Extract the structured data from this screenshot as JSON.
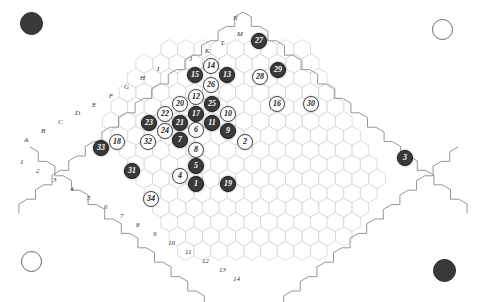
{
  "board": {
    "name": "hexagonal-go-board",
    "background_color": "#ffffff",
    "grid_color": "#cfcfcf",
    "edge_color": "#8a8a8a",
    "black_color": "#3a3a3a",
    "white_color": "#fdfdfd",
    "columns": [
      "A",
      "B",
      "C",
      "D",
      "E",
      "F",
      "G",
      "H",
      "I",
      "J",
      "K",
      "L",
      "M",
      "N"
    ],
    "rows": [
      "1",
      "2",
      "3",
      "4",
      "5",
      "6",
      "7",
      "8",
      "9",
      "10",
      "11",
      "12",
      "13",
      "14"
    ]
  },
  "corners": [
    {
      "name": "corner-marker-top-left",
      "color": "black",
      "x": 30,
      "y": 22,
      "size": 21
    },
    {
      "name": "corner-marker-top-right",
      "color": "white",
      "x": 441,
      "y": 28,
      "size": 19
    },
    {
      "name": "corner-marker-bottom-left",
      "color": "white",
      "x": 30,
      "y": 260,
      "size": 19
    },
    {
      "name": "corner-marker-bottom-right",
      "color": "black",
      "x": 443,
      "y": 269,
      "size": 21
    }
  ],
  "column_labels": [
    {
      "text": "A",
      "x": 24,
      "y": 136
    },
    {
      "text": "B",
      "x": 41,
      "y": 127
    },
    {
      "text": "C",
      "x": 58,
      "y": 118
    },
    {
      "text": "D",
      "x": 75,
      "y": 109
    },
    {
      "text": "E",
      "x": 92,
      "y": 101
    },
    {
      "text": "F",
      "x": 109,
      "y": 92
    },
    {
      "text": "G",
      "x": 124,
      "y": 83
    },
    {
      "text": "H",
      "x": 140,
      "y": 74
    },
    {
      "text": "I",
      "x": 157,
      "y": 65
    },
    {
      "text": "J",
      "x": 189,
      "y": 55
    },
    {
      "text": "K",
      "x": 205,
      "y": 47
    },
    {
      "text": "L",
      "x": 221,
      "y": 39
    },
    {
      "text": "M",
      "x": 237,
      "y": 30
    },
    {
      "text": "N",
      "x": 233,
      "y": 14
    }
  ],
  "row_labels": [
    {
      "text": "1",
      "x": 20,
      "y": 158
    },
    {
      "text": "2",
      "x": 36,
      "y": 167
    },
    {
      "text": "3",
      "x": 53,
      "y": 176
    },
    {
      "text": "4",
      "x": 70,
      "y": 185
    },
    {
      "text": "5",
      "x": 87,
      "y": 194
    },
    {
      "text": "6",
      "x": 104,
      "y": 203
    },
    {
      "text": "7",
      "x": 120,
      "y": 212
    },
    {
      "text": "8",
      "x": 136,
      "y": 221
    },
    {
      "text": "9",
      "x": 153,
      "y": 230
    },
    {
      "text": "10",
      "x": 168,
      "y": 239
    },
    {
      "text": "11",
      "x": 185,
      "y": 248
    },
    {
      "text": "12",
      "x": 202,
      "y": 257
    },
    {
      "text": "13",
      "x": 219,
      "y": 266
    },
    {
      "text": "14",
      "x": 233,
      "y": 275
    }
  ],
  "stones": [
    {
      "n": "27",
      "c": "black",
      "x": 259,
      "y": 41
    },
    {
      "n": "14",
      "c": "white",
      "x": 211,
      "y": 66
    },
    {
      "n": "15",
      "c": "black",
      "x": 195,
      "y": 75
    },
    {
      "n": "13",
      "c": "black",
      "x": 227,
      "y": 75
    },
    {
      "n": "29",
      "c": "black",
      "x": 278,
      "y": 70
    },
    {
      "n": "28",
      "c": "white",
      "x": 260,
      "y": 77
    },
    {
      "n": "26",
      "c": "white",
      "x": 211,
      "y": 85
    },
    {
      "n": "12",
      "c": "white",
      "x": 196,
      "y": 97
    },
    {
      "n": "25",
      "c": "black",
      "x": 212,
      "y": 104
    },
    {
      "n": "20",
      "c": "white",
      "x": 180,
      "y": 104
    },
    {
      "n": "16",
      "c": "white",
      "x": 277,
      "y": 104
    },
    {
      "n": "30",
      "c": "white",
      "x": 311,
      "y": 104
    },
    {
      "n": "22",
      "c": "white",
      "x": 165,
      "y": 114
    },
    {
      "n": "17",
      "c": "black",
      "x": 196,
      "y": 114
    },
    {
      "n": "10",
      "c": "white",
      "x": 228,
      "y": 114
    },
    {
      "n": "23",
      "c": "black",
      "x": 149,
      "y": 123
    },
    {
      "n": "21",
      "c": "black",
      "x": 180,
      "y": 123
    },
    {
      "n": "6",
      "c": "white",
      "x": 196,
      "y": 130
    },
    {
      "n": "11",
      "c": "black",
      "x": 212,
      "y": 123
    },
    {
      "n": "24",
      "c": "white",
      "x": 165,
      "y": 131
    },
    {
      "n": "9",
      "c": "black",
      "x": 228,
      "y": 131
    },
    {
      "n": "33",
      "c": "black",
      "x": 101,
      "y": 148
    },
    {
      "n": "18",
      "c": "white",
      "x": 117,
      "y": 142
    },
    {
      "n": "32",
      "c": "white",
      "x": 148,
      "y": 142
    },
    {
      "n": "7",
      "c": "black",
      "x": 180,
      "y": 140
    },
    {
      "n": "2",
      "c": "white",
      "x": 245,
      "y": 142
    },
    {
      "n": "8",
      "c": "white",
      "x": 196,
      "y": 150
    },
    {
      "n": "31",
      "c": "black",
      "x": 132,
      "y": 171
    },
    {
      "n": "5",
      "c": "black",
      "x": 196,
      "y": 166
    },
    {
      "n": "4",
      "c": "white",
      "x": 180,
      "y": 176
    },
    {
      "n": "1",
      "c": "black",
      "x": 196,
      "y": 184
    },
    {
      "n": "19",
      "c": "black",
      "x": 228,
      "y": 184
    },
    {
      "n": "34",
      "c": "white",
      "x": 151,
      "y": 199
    },
    {
      "n": "3",
      "c": "black",
      "x": 405,
      "y": 158
    }
  ]
}
